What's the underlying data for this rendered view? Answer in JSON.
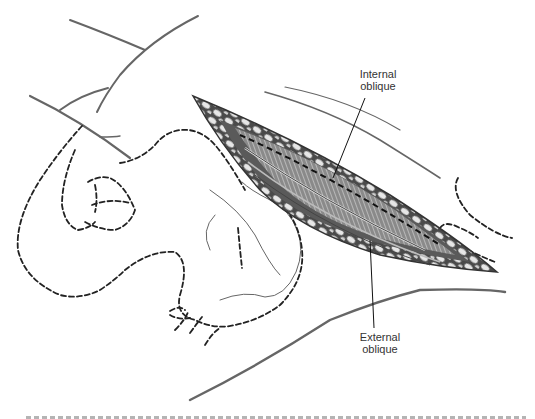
{
  "figure": {
    "type": "surgical-anatomy-illustration",
    "colors": {
      "outline": "#555555",
      "dashed": "#333333",
      "tissue_dark": "#3a3a3a",
      "tissue_mid": "#7a7a7a",
      "fat_globule": "#e8e8e8",
      "background": "#ffffff"
    },
    "labels": {
      "internal_oblique": {
        "line1": "Internal",
        "line2": "oblique"
      },
      "external_oblique": {
        "line1": "External",
        "line2": "oblique"
      }
    }
  }
}
